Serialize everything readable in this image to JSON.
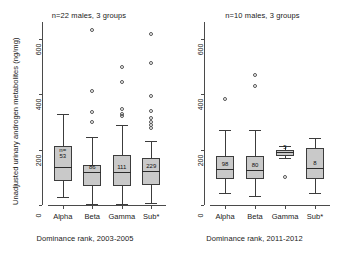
{
  "figure": {
    "ylabel": "Unadjusted urinary androgen metabolites (ng/mg)"
  },
  "chart_data": [
    {
      "type": "box",
      "panel": "left",
      "title": "n=22 males, 3 groups",
      "xlabel": "Dominance rank, 2003-2005",
      "ylabel": "Unadjusted urinary androgen metabolites (ng/mg)",
      "ylim": [
        0,
        660
      ],
      "yticks": [
        0,
        200,
        400,
        600
      ],
      "ytick_labels": [
        "0",
        "200",
        "400",
        "600"
      ],
      "categories": [
        "Alpha",
        "Beta",
        "Gamma",
        "Sub*"
      ],
      "grid": false,
      "legend": "none",
      "boxes": [
        {
          "category": "Alpha",
          "n_label": "n=\n53",
          "n": 53,
          "whisker_low": 28,
          "q1": 88,
          "median": 138,
          "q3": 212,
          "whisker_high": 330,
          "outliers": []
        },
        {
          "category": "Beta",
          "n_label": "86",
          "n": 86,
          "whisker_low": 5,
          "q1": 68,
          "median": 120,
          "q3": 145,
          "whisker_high": 245,
          "outliers": [
            300,
            335,
            412,
            630
          ]
        },
        {
          "category": "Gamma",
          "n_label": "111",
          "n": 111,
          "whisker_low": 3,
          "q1": 70,
          "median": 118,
          "q3": 182,
          "whisker_high": 288,
          "outliers": [
            320,
            330,
            345,
            442,
            498
          ]
        },
        {
          "category": "Sub*",
          "n_label": "229",
          "n": 229,
          "whisker_low": 8,
          "q1": 72,
          "median": 122,
          "q3": 168,
          "whisker_high": 232,
          "outliers": [
            278,
            288,
            300,
            312,
            340,
            392,
            512,
            618
          ]
        }
      ]
    },
    {
      "type": "box",
      "panel": "right",
      "title": "n=10 males, 3 groups",
      "xlabel": "Dominance rank, 2011-2012",
      "ylim": [
        0,
        660
      ],
      "yticks": [
        0,
        200,
        400,
        600
      ],
      "ytick_labels": [
        "0",
        "200",
        "400",
        "600"
      ],
      "categories": [
        "Alpha",
        "Beta",
        "Gamma",
        "Sub*"
      ],
      "grid": false,
      "legend": "none",
      "boxes": [
        {
          "category": "Alpha",
          "n_label": "98",
          "n": 98,
          "whisker_low": 45,
          "q1": 92,
          "median": 130,
          "q3": 178,
          "whisker_high": 272,
          "outliers": [
            382
          ]
        },
        {
          "category": "Beta",
          "n_label": "80",
          "n": 80,
          "whisker_low": 32,
          "q1": 92,
          "median": 128,
          "q3": 175,
          "whisker_high": 270,
          "outliers": [
            428,
            468
          ]
        },
        {
          "category": "Gamma",
          "n_label": "5",
          "n": 5,
          "whisker_low": 170,
          "q1": 178,
          "median": 190,
          "q3": 198,
          "whisker_high": 212,
          "outliers": [
            102
          ]
        },
        {
          "category": "Sub*",
          "n_label": "8",
          "n": 8,
          "whisker_low": 42,
          "q1": 95,
          "median": 135,
          "q3": 205,
          "whisker_high": 240,
          "outliers": []
        }
      ]
    }
  ]
}
